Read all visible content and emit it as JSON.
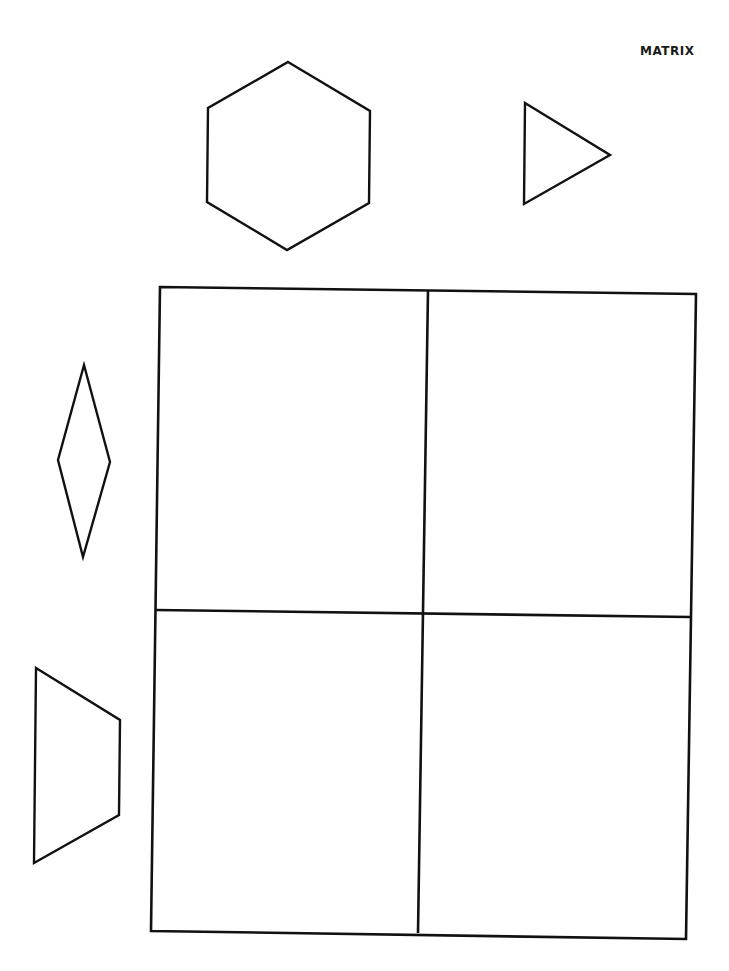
{
  "title": "MATRIX",
  "colors": {
    "stroke": "#111111",
    "background": "#ffffff"
  },
  "shapes": [
    {
      "name": "hexagon",
      "points": "288,62 370,111 369,203 287,250 207,202 208,108"
    },
    {
      "name": "triangle",
      "points": "525,103 610,155 524,204"
    },
    {
      "name": "diamond",
      "points": "84,365 110,462 83,557 58,460"
    },
    {
      "name": "trapezoid",
      "points": "36,668 120,720 119,815 34,863"
    }
  ],
  "matrix": {
    "rows": 2,
    "cols": 2,
    "outline": "160,287 696,294 686,939 151,931",
    "vertical_divider": "428,290 418,933",
    "horizontal_divider": "155,610 691,617",
    "cells": [
      {
        "row": 1,
        "col": 1,
        "content": ""
      },
      {
        "row": 1,
        "col": 2,
        "content": ""
      },
      {
        "row": 2,
        "col": 1,
        "content": ""
      },
      {
        "row": 2,
        "col": 2,
        "content": ""
      }
    ]
  }
}
